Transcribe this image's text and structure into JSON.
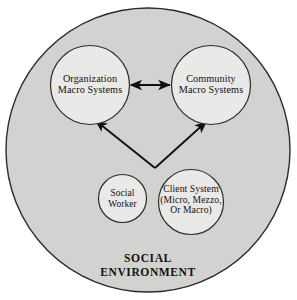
{
  "diagram": {
    "environment": {
      "name": "social-environment",
      "line1": "SOCIAL",
      "line2": "ENVIRONMENT",
      "fill": "#d2d2d0",
      "stroke": "#2b2b2b"
    },
    "nodes": [
      {
        "id": "organization-macro-systems",
        "line1": "Organization",
        "line2": "Macro Systems",
        "fill": "#e9e9e7",
        "stroke": "#2b2b2b"
      },
      {
        "id": "community-macro-systems",
        "line1": "Community",
        "line2": "Macro Systems",
        "fill": "#e9e9e7",
        "stroke": "#2b2b2b"
      },
      {
        "id": "social-worker",
        "line1": "Social",
        "line2": "Worker",
        "fill": "#e9e9e7",
        "stroke": "#2b2b2b"
      },
      {
        "id": "client-system",
        "line1": "Client System",
        "line2": "(Micro, Mezzo,",
        "line3": "Or Macro)",
        "fill": "#e9e9e7",
        "stroke": "#2b2b2b"
      }
    ],
    "connectors": [
      {
        "id": "organization-community-arrow",
        "from": "organization-macro-systems",
        "to": "community-macro-systems",
        "style": "double-headed",
        "color": "#111111"
      },
      {
        "id": "client-to-organization-arrow",
        "from": "client-system",
        "to": "organization-macro-systems",
        "style": "single-headed",
        "color": "#111111"
      },
      {
        "id": "client-to-community-arrow",
        "from": "client-system",
        "to": "community-macro-systems",
        "style": "single-headed",
        "color": "#111111"
      }
    ]
  }
}
